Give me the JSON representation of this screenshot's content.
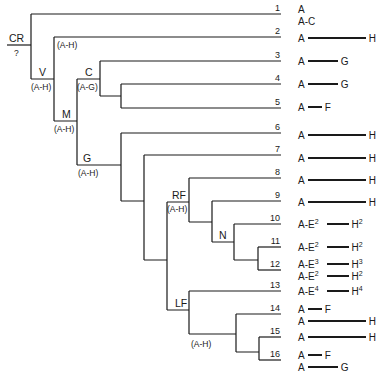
{
  "diagram": {
    "type": "phylogenetic-tree",
    "root": {
      "name": "CR",
      "range": "?"
    },
    "nodes": [
      {
        "id": "V",
        "name": "V",
        "range": "(A-H)"
      },
      {
        "id": "V2",
        "range": "(A-H)"
      },
      {
        "id": "M",
        "name": "M",
        "range": "(A-H)"
      },
      {
        "id": "C",
        "name": "C",
        "range": "(A-G)"
      },
      {
        "id": "G",
        "name": "G",
        "range": "(A-H)"
      },
      {
        "id": "RF",
        "name": "RF",
        "range": "(A-H)"
      },
      {
        "id": "N",
        "name": "N"
      },
      {
        "id": "LF",
        "name": "LF",
        "range": "(A-H)"
      }
    ],
    "leaves": [
      {
        "num": "1",
        "segments": [
          {
            "from": "A",
            "to": "",
            "len": 0
          },
          {
            "from": "A",
            "dash": "-",
            "to": "C",
            "len": 0
          }
        ]
      },
      {
        "num": "2",
        "segments": [
          {
            "from": "A",
            "to": "H",
            "len": 58
          }
        ]
      },
      {
        "num": "3",
        "segments": [
          {
            "from": "A",
            "to": "G",
            "len": 30
          }
        ]
      },
      {
        "num": "4",
        "segments": [
          {
            "from": "A",
            "to": "G",
            "len": 30
          }
        ]
      },
      {
        "num": "5",
        "segments": [
          {
            "from": "A",
            "to": "F",
            "len": 14
          }
        ]
      },
      {
        "num": "6",
        "segments": [
          {
            "from": "A",
            "to": "H",
            "len": 58
          }
        ]
      },
      {
        "num": "7",
        "segments": [
          {
            "from": "A",
            "to": "H",
            "len": 58
          }
        ]
      },
      {
        "num": "8",
        "segments": [
          {
            "from": "A",
            "to": "H",
            "len": 58
          }
        ]
      },
      {
        "num": "9",
        "segments": [
          {
            "from": "A",
            "to": "H",
            "len": 58
          }
        ]
      },
      {
        "num": "10",
        "segments": [
          {
            "from": "A",
            "mid": "E",
            "mid_sup": "2",
            "to": "H",
            "to_sup": "2",
            "len": 22
          }
        ]
      },
      {
        "num": "11",
        "segments": [
          {
            "from": "A",
            "mid": "E",
            "mid_sup": "2",
            "to": "H",
            "to_sup": "2",
            "len": 22
          }
        ]
      },
      {
        "num": "12",
        "segments": [
          {
            "from": "A",
            "mid": "E",
            "mid_sup": "3",
            "to": "H",
            "to_sup": "3",
            "len": 22
          },
          {
            "from": "A",
            "mid": "E",
            "mid_sup": "2",
            "to": "H",
            "to_sup": "2",
            "len": 22
          }
        ]
      },
      {
        "num": "13",
        "segments": [
          {
            "from": "A",
            "mid": "E",
            "mid_sup": "4",
            "to": "H",
            "to_sup": "4",
            "len": 22
          }
        ]
      },
      {
        "num": "14",
        "segments": [
          {
            "from": "A",
            "to": "F",
            "len": 14
          },
          {
            "from": "A",
            "to": "H",
            "len": 58
          }
        ]
      },
      {
        "num": "15",
        "segments": [
          {
            "from": "A",
            "to": "H",
            "len": 58
          }
        ]
      },
      {
        "num": "16",
        "segments": [
          {
            "from": "A",
            "to": "F",
            "len": 14
          },
          {
            "from": "A",
            "to": "G",
            "len": 30
          }
        ]
      }
    ],
    "colors": {
      "line": "#1a1a1a",
      "background": "#ffffff"
    }
  }
}
